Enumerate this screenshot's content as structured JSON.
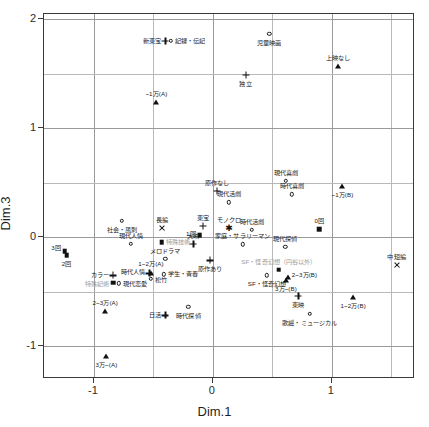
{
  "chart_data": {
    "type": "scatter",
    "title": "",
    "xlabel": "Dim.1",
    "ylabel": "Dim.3",
    "xlim": [
      -1.42,
      1.7
    ],
    "ylim": [
      -1.3,
      2.05
    ],
    "xticks": [
      -1,
      0,
      1
    ],
    "yticks": [
      2,
      1,
      0,
      -1
    ],
    "xtick_labels": [
      "-1",
      "0",
      "1"
    ],
    "ytick_labels": [
      "2",
      "1",
      "0",
      "-1"
    ],
    "grid": true,
    "gridlines_x": [
      -1.0,
      -0.5,
      0.0,
      0.5,
      1.0,
      1.5
    ],
    "gridlines_y": [
      2.0,
      1.5,
      1.0,
      0.5,
      0.0,
      -0.5,
      -1.0
    ],
    "legend": "none",
    "points": [
      {
        "label": "新東宝",
        "x": -0.4,
        "y": 1.805,
        "marker": "plus",
        "align": "right",
        "dy": 0,
        "gray": false
      },
      {
        "label": "記録・伝記",
        "x": -0.355,
        "y": 1.805,
        "marker": "circle",
        "align": "left",
        "dy": 0,
        "gray": false
      },
      {
        "label": "児童映画",
        "x": 0.475,
        "y": 1.87,
        "marker": "circle",
        "align": "center",
        "dy": 9,
        "gray": false
      },
      {
        "label": "上映なし",
        "x": 1.055,
        "y": 1.575,
        "marker": "tri",
        "align": "center",
        "dy": -8,
        "gray": false
      },
      {
        "label": "独立",
        "x": 0.275,
        "y": 1.49,
        "marker": "plus",
        "align": "center",
        "dy": 9,
        "gray": false
      },
      {
        "label": "~1万(A)",
        "x": -0.475,
        "y": 1.245,
        "marker": "tri",
        "align": "center",
        "dy": -8,
        "gray": false
      },
      {
        "label": "現代喜劇",
        "x": 0.615,
        "y": 0.52,
        "marker": "circle",
        "align": "center",
        "dy": -8,
        "gray": false
      },
      {
        "label": "原作なし",
        "x": 0.035,
        "y": 0.425,
        "marker": "plus",
        "align": "center",
        "dy": -8,
        "gray": false
      },
      {
        "label": "時代喜劇",
        "x": 0.665,
        "y": 0.395,
        "marker": "circle",
        "align": "center",
        "dy": -8,
        "gray": false
      },
      {
        "label": "~1万(B)",
        "x": 1.09,
        "y": 0.47,
        "marker": "tri",
        "align": "center",
        "dy": 9,
        "gray": false
      },
      {
        "label": "現代活劇",
        "x": 0.135,
        "y": 0.32,
        "marker": "circle",
        "align": "center",
        "dy": -8,
        "gray": false
      },
      {
        "label": "社会・風刺",
        "x": -0.765,
        "y": 0.15,
        "marker": "circle",
        "align": "center",
        "dy": 9,
        "gray": false
      },
      {
        "label": "長編",
        "x": -0.425,
        "y": 0.085,
        "marker": "x",
        "align": "center",
        "dy": -8,
        "gray": false
      },
      {
        "label": "東宝",
        "x": -0.085,
        "y": 0.105,
        "marker": "plus",
        "align": "center",
        "dy": -8,
        "gray": false
      },
      {
        "label": "モノクロ",
        "x": 0.135,
        "y": 0.085,
        "marker": "star",
        "align": "center",
        "dy": -8,
        "gray": false
      },
      {
        "label": "時代活劇",
        "x": 0.33,
        "y": 0.07,
        "marker": "circle",
        "align": "center",
        "dy": -8,
        "gray": false
      },
      {
        "label": "0回",
        "x": 0.895,
        "y": 0.075,
        "marker": "sq",
        "align": "center",
        "dy": -8,
        "gray": false
      },
      {
        "label": "1回",
        "x": -0.11,
        "y": 0.02,
        "marker": "sq",
        "align": "right",
        "dy": -1,
        "gray": false
      },
      {
        "label": "現代人情",
        "x": -0.69,
        "y": -0.06,
        "marker": "circle",
        "align": "center",
        "dy": -8,
        "gray": false
      },
      {
        "label": "特殊技術",
        "x": -0.43,
        "y": -0.045,
        "marker": "sq",
        "align": "left",
        "dy": 0,
        "gray": true
      },
      {
        "label": "大映",
        "x": -0.165,
        "y": -0.06,
        "marker": "plus",
        "align": "center",
        "dy": -8,
        "gray": false
      },
      {
        "label": "家庭・サラリーマン",
        "x": 0.25,
        "y": -0.065,
        "marker": "circle",
        "align": "center",
        "dy": -8,
        "gray": false
      },
      {
        "label": "現代探偵",
        "x": 0.61,
        "y": -0.085,
        "marker": "circle",
        "align": "center",
        "dy": -8,
        "gray": false
      },
      {
        "label": "3回",
        "x": -1.245,
        "y": -0.125,
        "marker": "sq",
        "align": "right",
        "dy": -3,
        "gray": false
      },
      {
        "label": "2回",
        "x": -1.23,
        "y": -0.165,
        "marker": "sq",
        "align": "center",
        "dy": 9,
        "gray": false
      },
      {
        "label": "メロドラマ",
        "x": -0.4,
        "y": -0.195,
        "marker": "circle",
        "align": "center",
        "dy": -8,
        "gray": false
      },
      {
        "label": "原作あり",
        "x": -0.025,
        "y": -0.21,
        "marker": "plus",
        "align": "center",
        "dy": 9,
        "gray": false
      },
      {
        "label": "中短編",
        "x": 1.545,
        "y": -0.255,
        "marker": "x",
        "align": "center",
        "dy": -8,
        "gray": false
      },
      {
        "label": "SF・怪奇幻想（円谷以外）",
        "x": 0.555,
        "y": -0.295,
        "marker": "sq",
        "align": "center",
        "dy": -8,
        "gray": true
      },
      {
        "label": "1~2万(A)",
        "x": -0.52,
        "y": -0.33,
        "marker": "tri",
        "align": "center",
        "dy": -9,
        "gray": false
      },
      {
        "label": "時代人情",
        "x": -0.535,
        "y": -0.33,
        "marker": "plus",
        "align": "right",
        "dy": -1,
        "gray": false
      },
      {
        "label": "学生・青春",
        "x": -0.415,
        "y": -0.34,
        "marker": "circle",
        "align": "left",
        "dy": 0,
        "gray": false
      },
      {
        "label": "カラー",
        "x": -0.84,
        "y": -0.35,
        "marker": "plus",
        "align": "right",
        "dy": 0,
        "gray": false
      },
      {
        "label": "SF・怪奇幻想",
        "x": 0.455,
        "y": -0.35,
        "marker": "circle",
        "align": "center",
        "dy": 9,
        "gray": false
      },
      {
        "label": "2~3万(B)",
        "x": 0.63,
        "y": -0.36,
        "marker": "tri",
        "align": "left",
        "dy": -2,
        "gray": false
      },
      {
        "label": "松竹",
        "x": -0.52,
        "y": -0.38,
        "marker": "circle",
        "align": "left",
        "dy": 1,
        "gray": false
      },
      {
        "label": "3万~(B)",
        "x": 0.615,
        "y": -0.39,
        "marker": "tri",
        "align": "center",
        "dy": 9,
        "gray": false
      },
      {
        "label": "特殊記術",
        "x": -0.84,
        "y": -0.415,
        "marker": "sq",
        "align": "right",
        "dy": 1,
        "gray": true
      },
      {
        "label": "現代恋愛",
        "x": -0.79,
        "y": -0.42,
        "marker": "circle",
        "align": "left",
        "dy": 1,
        "gray": false
      },
      {
        "label": "東映",
        "x": 0.72,
        "y": -0.54,
        "marker": "plus",
        "align": "center",
        "dy": 9,
        "gray": false
      },
      {
        "label": "1~2万(B)",
        "x": 1.18,
        "y": -0.545,
        "marker": "tri",
        "align": "center",
        "dy": 9,
        "gray": false
      },
      {
        "label": "時代探偵",
        "x": -0.205,
        "y": -0.64,
        "marker": "circle",
        "align": "center",
        "dy": 9,
        "gray": false
      },
      {
        "label": "2~3万(A)",
        "x": -0.905,
        "y": -0.675,
        "marker": "tri",
        "align": "center",
        "dy": -8,
        "gray": false
      },
      {
        "label": "歌謡・ミュージカル",
        "x": 0.815,
        "y": -0.7,
        "marker": "circle",
        "align": "center",
        "dy": 9,
        "gray": false
      },
      {
        "label": "日活",
        "x": -0.4,
        "y": -0.715,
        "marker": "plus",
        "align": "right",
        "dy": 0,
        "gray": false
      },
      {
        "label": "3万~(A)",
        "x": -0.895,
        "y": -1.085,
        "marker": "tri",
        "align": "center",
        "dy": 9,
        "gray": false
      }
    ]
  }
}
